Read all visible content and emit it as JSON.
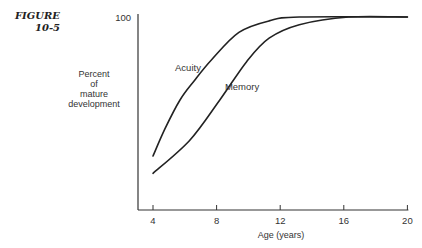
{
  "figure": {
    "label_line1": "FIGURE",
    "label_line2": "10-5"
  },
  "chart_data": {
    "type": "line",
    "title": "",
    "xlabel": "Age (years)",
    "ylabel": "Percent of mature development",
    "ylabel_lines": [
      "Percent",
      "of",
      "mature",
      "development"
    ],
    "x_ticks": [
      4,
      8,
      12,
      16,
      20
    ],
    "y_ticks": [
      100
    ],
    "xlim": [
      4,
      20
    ],
    "ylim": [
      0,
      100
    ],
    "grid": false,
    "legend": "inline labels",
    "series": [
      {
        "name": "Acuity",
        "x": [
          4,
          4.75,
          5.7,
          6.6,
          7.7,
          9.4,
          11.3,
          13.2,
          20
        ],
        "values": [
          28,
          42,
          57,
          67,
          78,
          92,
          98,
          100,
          100
        ]
      },
      {
        "name": "Memory",
        "x": [
          4,
          6.3,
          8.2,
          9.9,
          11.3,
          13.2,
          16.3,
          20
        ],
        "values": [
          19,
          36,
          57,
          77,
          89,
          96,
          100,
          100
        ]
      }
    ],
    "annotations": [
      {
        "text": "Acuity",
        "x": 6.2,
        "y": 72
      },
      {
        "text": "Memory",
        "x": 9.6,
        "y": 62
      }
    ]
  }
}
